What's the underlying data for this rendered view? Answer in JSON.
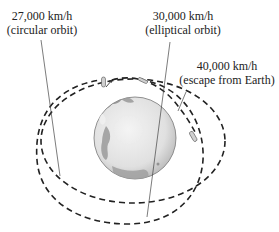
{
  "diagram": {
    "labels": {
      "circular": {
        "speed": "27,000 km/h",
        "caption": "(circular orbit)"
      },
      "elliptical": {
        "speed": "30,000 km/h",
        "caption": "(elliptical orbit)"
      },
      "escape": {
        "speed": "40,000 km/h",
        "caption": "(escape from Earth)"
      }
    },
    "colors": {
      "ink": "#222222",
      "earth_land": "#8a8a8a",
      "earth_ocean": "#e6e6e6",
      "earth_edge": "#6f6f6f"
    }
  }
}
